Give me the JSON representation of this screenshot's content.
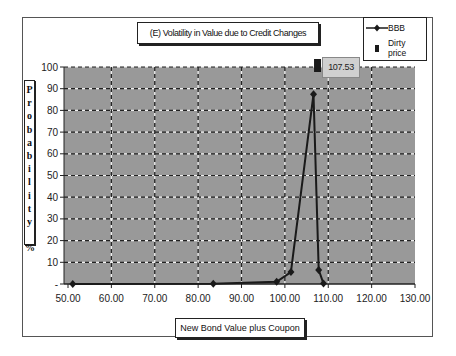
{
  "chart_data": {
    "type": "line",
    "title": "(E) Volatility in Value due to Credit Changes",
    "xlabel": "New Bond Value plus Coupon",
    "ylabel": "Probability %",
    "ylabel_chars": [
      "P",
      "r",
      "o",
      "b",
      "a",
      "b",
      "i",
      "l",
      "i",
      "t",
      "y",
      "",
      "%"
    ],
    "xlim": [
      50,
      130
    ],
    "ylim": [
      0,
      100
    ],
    "x_ticks": [
      "50.00",
      "60.00",
      "70.00",
      "80.00",
      "90.00",
      "100.00",
      "110.00",
      "120.00",
      "130.00"
    ],
    "y_ticks": [
      "-",
      "10",
      "20",
      "30",
      "40",
      "50",
      "60",
      "70",
      "80",
      "90",
      "100"
    ],
    "grid": true,
    "legend_position": "top-right",
    "series": [
      {
        "name": "BBB",
        "marker": "diamond",
        "color": "#1a1a1a",
        "points": [
          {
            "x": 51.1,
            "y": 0.0
          },
          {
            "x": 83.5,
            "y": 0.1
          },
          {
            "x": 98.1,
            "y": 1.0
          },
          {
            "x": 101.4,
            "y": 5.5
          },
          {
            "x": 106.6,
            "y": 87.5
          },
          {
            "x": 107.8,
            "y": 6.5
          },
          {
            "x": 108.9,
            "y": 0.2
          }
        ]
      },
      {
        "name": "Dirty price",
        "marker": "square",
        "color": "#1a1a1a",
        "points": [
          {
            "x": 107.53,
            "y": 100
          }
        ],
        "annotation": "107.53"
      }
    ]
  },
  "legend": {
    "items": [
      {
        "label": "BBB",
        "icon": "line-diamond-icon"
      },
      {
        "label": "Dirty price",
        "icon": "square-marker-icon"
      }
    ]
  },
  "colors": {
    "plot_background": "#999999",
    "grid": "#f0f0f0",
    "series_line": "#1a1a1a",
    "annotation_box": "#d0d0d0"
  }
}
